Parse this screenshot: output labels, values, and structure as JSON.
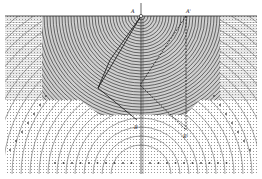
{
  "figure": {
    "type": "technical-diagram",
    "labels": {
      "top_left_point": "A",
      "top_right_point": "A'",
      "bottom_left_point": "B",
      "bottom_right_point": "B'"
    },
    "colors": {
      "ink": "#222222",
      "shade": "#555555",
      "light": "#9a9a9a",
      "paper": "#ffffff"
    }
  }
}
